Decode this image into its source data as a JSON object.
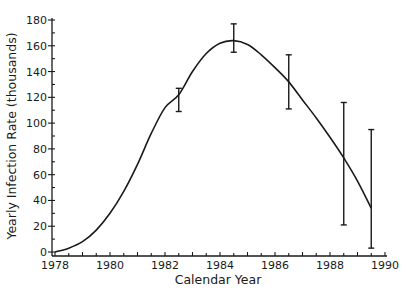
{
  "chart_data": {
    "type": "line",
    "title": "",
    "xlabel": "Calendar Year",
    "ylabel": "Yearly Infection Rate (thousands)",
    "xlim": [
      1978,
      1990
    ],
    "ylim": [
      0,
      180
    ],
    "x_ticks": [
      1978,
      1980,
      1982,
      1984,
      1986,
      1988,
      1990
    ],
    "x_tick_labels": [
      "1978",
      "1980",
      "1982",
      "1984",
      "1986",
      "1988",
      "1990"
    ],
    "y_ticks": [
      0,
      20,
      40,
      60,
      80,
      100,
      120,
      140,
      160,
      180
    ],
    "y_tick_labels": [
      "0",
      "20",
      "40",
      "60",
      "80",
      "100",
      "120",
      "140",
      "160",
      "180"
    ],
    "grid": false,
    "legend": null,
    "series": [
      {
        "name": "Fitted infection curve",
        "x": [
          1978.0,
          1978.5,
          1979.0,
          1979.5,
          1980.0,
          1980.5,
          1981.0,
          1981.5,
          1982.0,
          1982.5,
          1983.0,
          1983.5,
          1984.0,
          1984.5,
          1985.0,
          1985.5,
          1986.0,
          1986.5,
          1987.0,
          1987.5,
          1988.0,
          1988.5,
          1989.0,
          1989.5
        ],
        "values": [
          0,
          3,
          8,
          17,
          30,
          47,
          68,
          92,
          112,
          122,
          140,
          154,
          162,
          164,
          161,
          153,
          143,
          132,
          118,
          104,
          89,
          73,
          55,
          34
        ]
      }
    ],
    "error_bars": [
      {
        "x": 1982.5,
        "center": 120,
        "low": 109,
        "high": 127
      },
      {
        "x": 1984.5,
        "center": 164,
        "low": 155,
        "high": 177
      },
      {
        "x": 1986.5,
        "center": 133,
        "low": 111,
        "high": 153
      },
      {
        "x": 1988.5,
        "center": 70,
        "low": 21,
        "high": 116
      },
      {
        "x": 1989.5,
        "center": 34,
        "low": 3,
        "high": 95
      }
    ]
  },
  "axes": {
    "x_title": "Calendar Year",
    "y_title": "Yearly Infection Rate (thousands)"
  }
}
